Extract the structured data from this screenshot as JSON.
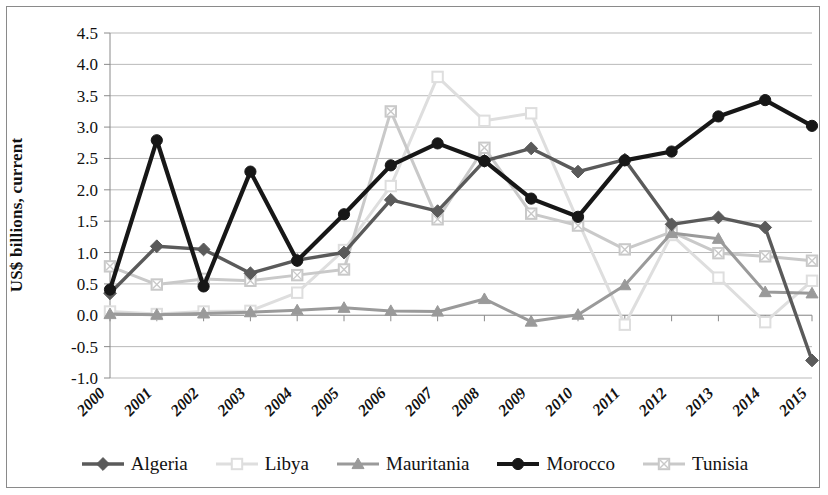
{
  "chart_data": {
    "type": "line",
    "title": "",
    "subtitle": "",
    "xlabel": "",
    "ylabel": "US$ billions, current",
    "grid": true,
    "legend_position": "bottom",
    "xlim": [
      2000,
      2015
    ],
    "ylim": [
      -1.0,
      4.5
    ],
    "ytick_step": 0.5,
    "categories": [
      "2000",
      "2001",
      "2002",
      "2003",
      "2004",
      "2005",
      "2006",
      "2007",
      "2008",
      "2009",
      "2010",
      "2011",
      "2012",
      "2013",
      "2014",
      "2015"
    ],
    "yticks": [
      "4.5",
      "4.0",
      "3.5",
      "3.0",
      "2.5",
      "2.0",
      "1.5",
      "1.0",
      "0.5",
      "0.0",
      "-0.5",
      "-1.0"
    ],
    "series": [
      {
        "name": "Algeria",
        "color": "#5a5a5a",
        "marker": "diamond",
        "values": [
          0.35,
          1.1,
          1.05,
          0.67,
          0.88,
          1.0,
          1.84,
          1.66,
          2.46,
          2.66,
          2.29,
          2.48,
          1.45,
          1.56,
          1.4,
          -0.72
        ]
      },
      {
        "name": "Libya",
        "color": "#dedede",
        "marker": "square",
        "values": [
          0.06,
          0.02,
          0.06,
          0.07,
          0.36,
          1.04,
          2.06,
          3.8,
          3.1,
          3.22,
          1.5,
          -0.15,
          1.28,
          0.6,
          -0.11,
          0.55
        ]
      },
      {
        "name": "Mauritania",
        "color": "#9a9a9a",
        "marker": "triangle",
        "values": [
          0.02,
          0.01,
          0.03,
          0.05,
          0.08,
          0.12,
          0.07,
          0.06,
          0.26,
          -0.1,
          0.01,
          0.48,
          1.31,
          1.22,
          0.37,
          0.35
        ]
      },
      {
        "name": "Morocco",
        "color": "#171717",
        "marker": "circle",
        "values": [
          0.41,
          2.79,
          0.46,
          2.29,
          0.87,
          1.61,
          2.39,
          2.74,
          2.46,
          1.86,
          1.57,
          2.47,
          2.61,
          3.17,
          3.43,
          3.02
        ]
      },
      {
        "name": "Tunisia",
        "color": "#c9c9c9",
        "marker": "square-x",
        "values": [
          0.78,
          0.49,
          0.58,
          0.55,
          0.64,
          0.73,
          3.25,
          1.53,
          2.67,
          1.62,
          1.43,
          1.05,
          1.33,
          0.99,
          0.94,
          0.87
        ]
      }
    ]
  },
  "legend": {
    "items": [
      {
        "label": "Algeria"
      },
      {
        "label": "Libya"
      },
      {
        "label": "Mauritania"
      },
      {
        "label": "Morocco"
      },
      {
        "label": "Tunisia"
      }
    ]
  }
}
